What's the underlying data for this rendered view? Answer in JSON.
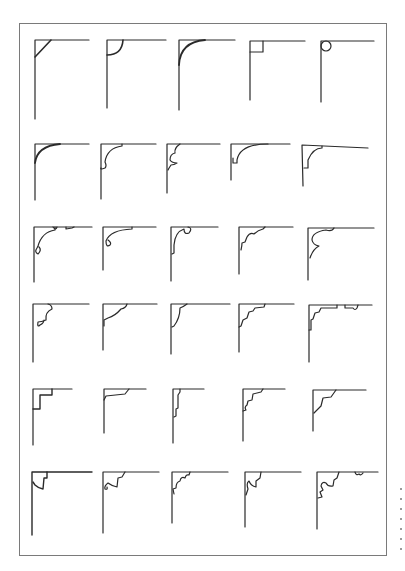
{
  "plate": {
    "subject": "corner ornament profiles",
    "rows": 6,
    "columns": 5,
    "ink_color": "#2a2a2a",
    "frame_color": "#7a7a7a",
    "paper_color": "#ffffff"
  },
  "rows": [
    {
      "row": 1,
      "items": [
        "straight-chamfer",
        "quarter-round-fillet",
        "large-cove-curve",
        "square-notch",
        "circle-bead"
      ]
    },
    {
      "row": 2,
      "items": [
        "sweeping-cove",
        "cove-with-bead",
        "double-scroll-cove",
        "cove-with-step",
        "cove-with-step-long"
      ]
    },
    {
      "row": 3,
      "items": [
        "scroll-with-beads",
        "scroll-with-bead",
        "ogee-scroll",
        "wave-scroll",
        "reverse-ogee-scroll"
      ]
    },
    {
      "row": 4,
      "items": [
        "bead-and-cove-bracket",
        "ogee-bracket",
        "flat-ogee-bracket",
        "stepped-scroll-bracket",
        "stepped-bracket-with-bead"
      ]
    },
    {
      "row": 5,
      "items": [
        "double-square-step",
        "stepped-angled-fillet",
        "narrow-stepped-profile",
        "stepped-bead-profile",
        "angled-step-bracket"
      ]
    },
    {
      "row": 6,
      "items": [
        "heavy-cove-bracket",
        "scroll-bead-bracket",
        "wavy-scroll-bracket",
        "double-wave-bracket",
        "ornate-scroll-with-beads"
      ]
    }
  ],
  "margin_marks": 7
}
